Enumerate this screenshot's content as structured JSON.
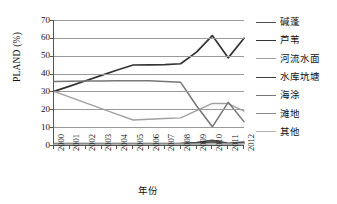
{
  "chart_data": {
    "type": "line",
    "title": "",
    "xlabel": "年份",
    "ylabel": "PLAND (%)",
    "xlim": [
      2000,
      2012
    ],
    "ylim": [
      0,
      70
    ],
    "ytick_step": 10,
    "grid": true,
    "legend_position": "right",
    "categories": [
      "2000",
      "2001",
      "2002",
      "2003",
      "2004",
      "2005",
      "2006",
      "2007",
      "2008",
      "2009",
      "2010",
      "2011",
      "2012"
    ],
    "yticks": [
      "0",
      "10",
      "20",
      "30",
      "40",
      "50",
      "60",
      "70"
    ],
    "series": [
      {
        "name": "碱蓬",
        "color": "#4d4d4d",
        "width": 1.6,
        "values": [
          0.8,
          0.8,
          0.8,
          0.8,
          0.8,
          0.8,
          0.8,
          0.8,
          0.9,
          1.4,
          2.6,
          0.9,
          1.7
        ]
      },
      {
        "name": "芦苇",
        "color": "#333333",
        "width": 1.7,
        "values": [
          30.0,
          33.0,
          36.0,
          39.0,
          42.0,
          44.8,
          44.9,
          45.0,
          45.5,
          52.0,
          61.3,
          48.8,
          59.8
        ]
      },
      {
        "name": "河流水面",
        "color": "#a0a0a0",
        "width": 1.4,
        "values": [
          30.0,
          26.8,
          23.6,
          20.4,
          17.2,
          14.0,
          14.4,
          14.8,
          15.2,
          19.3,
          23.3,
          23.2,
          19.0
        ]
      },
      {
        "name": "水库坑塘",
        "color": "#3a3a3a",
        "width": 1.6,
        "values": [
          0.6,
          0.6,
          0.6,
          0.6,
          0.6,
          0.6,
          0.6,
          0.6,
          0.6,
          0.8,
          1.6,
          0.7,
          1.0
        ]
      },
      {
        "name": "海涂",
        "color": "#767676",
        "width": 1.5,
        "values": [
          35.6,
          35.7,
          35.8,
          35.9,
          36.0,
          36.0,
          36.0,
          35.6,
          35.1,
          22.0,
          10.2,
          23.9,
          13.1
        ]
      },
      {
        "name": "滩地",
        "color": "#878787",
        "width": 1.4,
        "values": [
          0.5,
          0.5,
          0.5,
          0.5,
          0.5,
          0.5,
          0.5,
          0.5,
          0.5,
          0.6,
          1.0,
          0.6,
          0.8
        ]
      },
      {
        "name": "其他",
        "color": "#b3b3b3",
        "width": 1.4,
        "values": [
          0.4,
          0.4,
          0.4,
          0.4,
          0.4,
          0.4,
          0.4,
          0.4,
          0.4,
          0.5,
          0.7,
          0.5,
          0.6
        ]
      }
    ]
  }
}
